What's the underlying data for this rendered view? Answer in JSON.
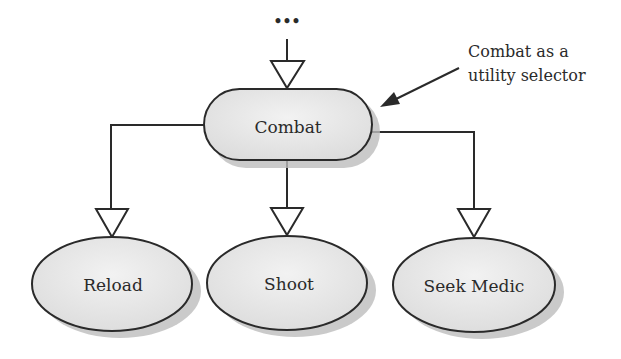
{
  "diagram": {
    "type": "behavior-tree",
    "parent_ellipsis": "•••",
    "root": {
      "label": "Combat",
      "shape": "rounded-rectangle"
    },
    "children": [
      {
        "label": "Reload",
        "shape": "ellipse"
      },
      {
        "label": "Shoot",
        "shape": "ellipse"
      },
      {
        "label": "Seek Medic",
        "shape": "ellipse"
      }
    ],
    "annotation": {
      "line1": "Combat as a",
      "line2": "utility selector"
    },
    "colors": {
      "stroke": "#2a2a2a",
      "node_fill": "#e6e6e6",
      "shadow": "#bdbdbd",
      "background": "#ffffff"
    }
  }
}
